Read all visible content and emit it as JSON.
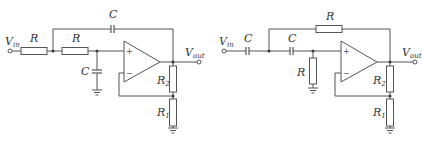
{
  "diagrams": [
    {
      "name": "sallen-key-lowpass",
      "labels": {
        "vin": "V",
        "vin_sub": "in",
        "vout": "V",
        "vout_sub": "out",
        "series_r1": "R",
        "series_r2": "R",
        "feedback_c": "C",
        "shunt_c": "C",
        "r2": "R",
        "r2_sub": "2",
        "r1": "R",
        "r1_sub": "1",
        "plus": "+",
        "minus": "−"
      }
    },
    {
      "name": "sallen-key-highpass",
      "labels": {
        "vin": "V",
        "vin_sub": "in",
        "vout": "V",
        "vout_sub": "out",
        "series_c1": "C",
        "series_c2": "C",
        "feedback_r": "R",
        "shunt_r": "R",
        "r2": "R",
        "r2_sub": "2",
        "r1": "R",
        "r1_sub": "1",
        "plus": "+",
        "minus": "−"
      }
    }
  ]
}
